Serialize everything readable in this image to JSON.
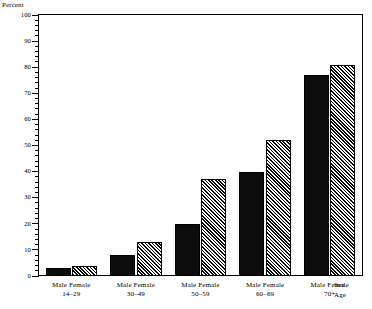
{
  "chart_data": {
    "type": "bar",
    "title": "",
    "xlabel": "Age",
    "ylabel": "Percent",
    "ylim": [
      0,
      100
    ],
    "ytick_step": 10,
    "yticks": [
      0,
      10,
      20,
      30,
      40,
      50,
      60,
      70,
      80,
      90,
      100
    ],
    "minor_ticks": true,
    "grid": false,
    "legend_position": "none",
    "series_label": "Sex",
    "categories": [
      "14–29",
      "30–49",
      "50–59",
      "60–69",
      "70+"
    ],
    "series": [
      {
        "name": "Male",
        "values": [
          3,
          8,
          20,
          40,
          77
        ]
      },
      {
        "name": "Female",
        "values": [
          4,
          13,
          37,
          52,
          81
        ]
      }
    ]
  },
  "axis": {
    "y_title": "Percent",
    "sex_axis_name": "Sex",
    "age_axis_name": "Age"
  },
  "groups": [
    {
      "sex_labels": "Male Female",
      "age": "14–29"
    },
    {
      "sex_labels": "Male Female",
      "age": "30–49"
    },
    {
      "sex_labels": "Male Female",
      "age": "50–59"
    },
    {
      "sex_labels": "Male Female",
      "age": "60–69"
    },
    {
      "sex_labels": "Male Female",
      "age": "70+"
    }
  ],
  "colors": {
    "male_fill": "#0d0d0d",
    "female_fill": "#ffffff",
    "female_hatch": "#000000",
    "axis": "#000000",
    "background": "#ffffff"
  }
}
